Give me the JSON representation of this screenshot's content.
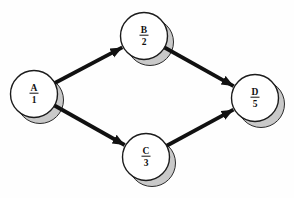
{
  "diagram": {
    "background": "#fefefe",
    "node_fill": "#ffffff",
    "node_stroke": "#1b1b1b",
    "shadow_fill": "#c9c9c9",
    "shadow_stroke": "#2a2a2a",
    "arrow_color": "#111111",
    "text_color": "#111111",
    "node_radius": 23.5,
    "shadow_offset_x": 6,
    "shadow_offset_y": 6,
    "edge_stroke_width": 3.8,
    "nodes": [
      {
        "id": "A",
        "label": "A",
        "value": "1",
        "x": 34,
        "y": 94
      },
      {
        "id": "B",
        "label": "B",
        "value": "2",
        "x": 144,
        "y": 36
      },
      {
        "id": "C",
        "label": "C",
        "value": "3",
        "x": 146,
        "y": 157
      },
      {
        "id": "D",
        "label": "D",
        "value": "5",
        "x": 255,
        "y": 98
      }
    ],
    "edges": [
      {
        "from": "A",
        "to": "B"
      },
      {
        "from": "A",
        "to": "C"
      },
      {
        "from": "B",
        "to": "D"
      },
      {
        "from": "C",
        "to": "D"
      }
    ]
  }
}
